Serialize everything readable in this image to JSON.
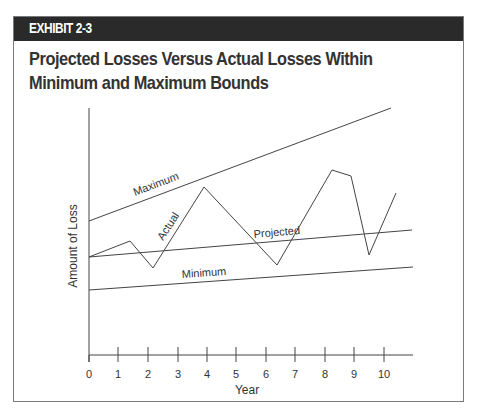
{
  "exhibit_label": "EXHIBIT 2-3",
  "title": "Projected Losses Versus Actual Losses Within Minimum and Maximum Bounds",
  "chart_data": {
    "type": "line",
    "title": "Projected Losses Versus Actual Losses Within Minimum and Maximum Bounds",
    "xlabel": "Year",
    "ylabel": "Amount of Loss",
    "x_ticks": [
      "0",
      "1",
      "2",
      "3",
      "4",
      "5",
      "6",
      "7",
      "8",
      "9",
      "10"
    ],
    "xlim": [
      0,
      11
    ],
    "grid": false,
    "legend": "inline labels",
    "series": [
      {
        "name": "Maximum",
        "points": [
          [
            0,
            0.62
          ],
          [
            10.3,
            1.0
          ]
        ]
      },
      {
        "name": "Actual",
        "points": [
          [
            0,
            0.41
          ],
          [
            1.4,
            0.47
          ],
          [
            2.2,
            0.38
          ],
          [
            3.9,
            0.71
          ],
          [
            6.4,
            0.39
          ],
          [
            8.2,
            0.73
          ],
          [
            8.8,
            0.71
          ],
          [
            9.5,
            0.42
          ],
          [
            10.4,
            0.63
          ]
        ]
      },
      {
        "name": "Projected",
        "points": [
          [
            0,
            0.41
          ],
          [
            10.9,
            0.5
          ]
        ]
      },
      {
        "name": "Minimum",
        "points": [
          [
            0,
            0.3
          ],
          [
            10.9,
            0.38
          ]
        ]
      }
    ]
  },
  "labels": {
    "maximum": "Maximum",
    "actual": "Actual",
    "projected": "Projected",
    "minimum": "Minimum",
    "year": "Year",
    "amount": "Amount of Loss"
  }
}
